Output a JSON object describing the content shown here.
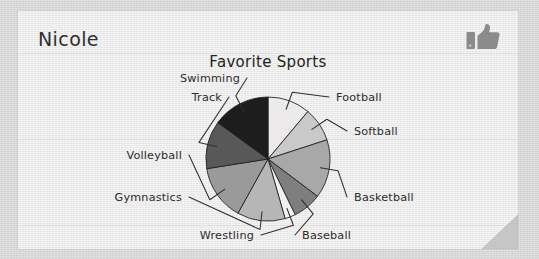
{
  "student": {
    "name": "Nicole"
  },
  "icons": {
    "thumbs_up": "thumbs-up-icon",
    "page_fold": "folded-corner-icon"
  },
  "colors": {
    "board_background": "#d7d7d7",
    "card_background": "#ececec",
    "ink": "#2c2c2c",
    "thumb": "#8b8b8b",
    "fold": "#c6c6c6"
  },
  "chart_data": {
    "type": "pie",
    "title": "Favorite Sports",
    "xlabel": "",
    "ylabel": "",
    "start_angle_deg": 0,
    "direction": "clockwise",
    "labels_position": "outside-with-leader-lines",
    "legend": "none",
    "grid": false,
    "categories": [
      "Football",
      "Softball",
      "Basketball",
      "Baseball",
      "Wrestling",
      "Gymnastics",
      "Volleyball",
      "Track",
      "Swimming"
    ],
    "values": [
      40,
      32,
      55,
      27,
      10,
      45,
      52,
      45,
      54
    ],
    "units": "degrees",
    "slices": [
      {
        "label": "Football",
        "angle_deg": 40,
        "color": "#eceaea",
        "label_side": "right"
      },
      {
        "label": "Softball",
        "angle_deg": 32,
        "color": "#c9c9c9",
        "label_side": "right"
      },
      {
        "label": "Basketball",
        "angle_deg": 55,
        "color": "#a8a8a8",
        "label_side": "right"
      },
      {
        "label": "Baseball",
        "angle_deg": 27,
        "color": "#7e7e7e",
        "label_side": "bottom"
      },
      {
        "label": "Wrestling",
        "angle_deg": 10,
        "color": "#f2f0f0",
        "label_side": "bottom"
      },
      {
        "label": "Gymnastics",
        "angle_deg": 45,
        "color": "#b6b6b6",
        "label_side": "left"
      },
      {
        "label": "Volleyball",
        "angle_deg": 52,
        "color": "#9a9a9a",
        "label_side": "left"
      },
      {
        "label": "Track",
        "angle_deg": 45,
        "color": "#585858",
        "label_side": "left"
      },
      {
        "label": "Swimming",
        "angle_deg": 54,
        "color": "#1d1d1d",
        "label_side": "left"
      }
    ]
  }
}
